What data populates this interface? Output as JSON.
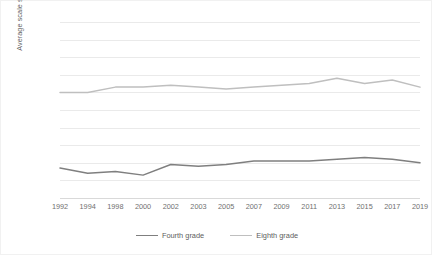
{
  "chart_data": {
    "type": "line",
    "title": "",
    "xlabel": "",
    "ylabel": "Average scale scores",
    "categories": [
      "1992",
      "1994",
      "1998",
      "2000",
      "2002",
      "2003",
      "2005",
      "2007",
      "2009",
      "2011",
      "2013",
      "2015",
      "2017",
      "2019"
    ],
    "series": [
      {
        "name": "Fourth grade",
        "color": "#7f7f7f",
        "values": [
          217,
          214,
          215,
          213,
          219,
          218,
          219,
          221,
          221,
          221,
          222,
          223,
          222,
          220
        ]
      },
      {
        "name": "Eighth grade",
        "color": "#bfbfbf",
        "values": [
          260,
          260,
          263,
          263,
          264,
          263,
          262,
          263,
          264,
          265,
          268,
          265,
          267,
          263
        ]
      }
    ],
    "ylim": [
      200,
      300
    ],
    "ytick_step": 10,
    "yticks": [
      "300",
      "290",
      "280",
      "270",
      "260",
      "250",
      "240",
      "230",
      "220",
      "210",
      "200"
    ],
    "grid": true,
    "legend_position": "bottom"
  },
  "legend": {
    "items": [
      {
        "label": "Fourth grade",
        "color": "#7f7f7f"
      },
      {
        "label": "Eighth grade",
        "color": "#bfbfbf"
      }
    ]
  },
  "axes": {
    "y_title": "Average scale scores"
  }
}
